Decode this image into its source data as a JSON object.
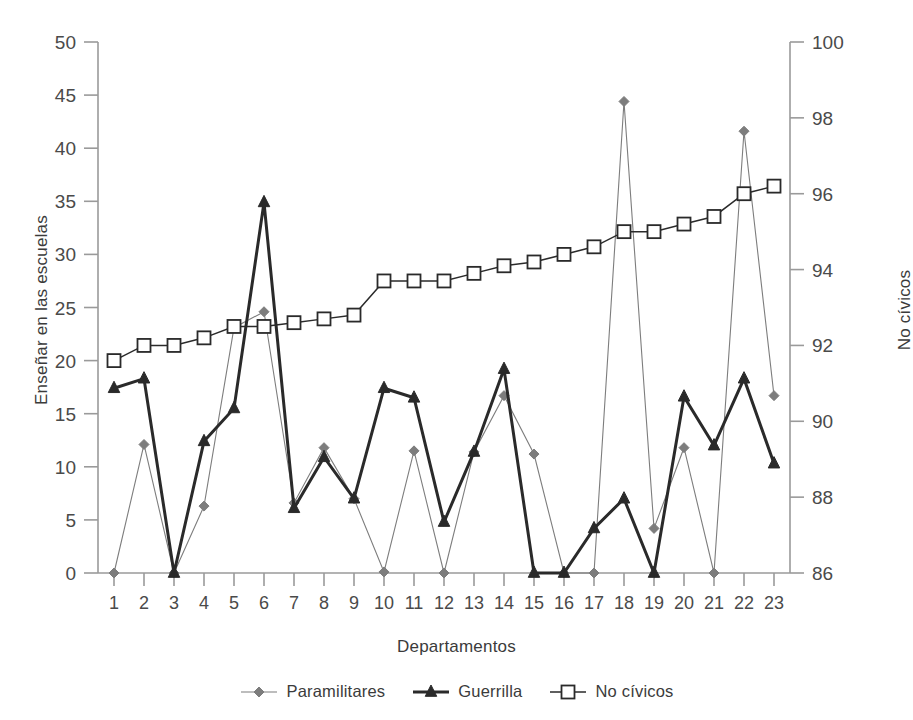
{
  "chart_data": {
    "type": "line",
    "title": "",
    "subtitle": "",
    "xlabel": "Departamentos",
    "ylabel": "Enseñar en las escuelas",
    "ylabel_right": "No cívicos",
    "categories": [
      "1",
      "2",
      "3",
      "4",
      "5",
      "6",
      "7",
      "8",
      "9",
      "10",
      "11",
      "12",
      "13",
      "14",
      "15",
      "16",
      "17",
      "18",
      "19",
      "20",
      "21",
      "22",
      "23"
    ],
    "x": [
      1,
      2,
      3,
      4,
      5,
      6,
      7,
      8,
      9,
      10,
      11,
      12,
      13,
      14,
      15,
      16,
      17,
      18,
      19,
      20,
      21,
      22,
      23
    ],
    "ylim": [
      0,
      50
    ],
    "yticks": [
      0,
      5,
      10,
      15,
      20,
      25,
      30,
      35,
      40,
      45,
      50
    ],
    "ylim_right": [
      86,
      100
    ],
    "yticks_right": [
      86,
      88,
      90,
      92,
      94,
      96,
      98,
      100
    ],
    "grid": false,
    "legend_position": "bottom",
    "series": [
      {
        "name": "Paramilitares",
        "axis": "left",
        "marker": "diamond",
        "color": "#7d7d7d",
        "values": [
          0.0,
          12.1,
          0.0,
          6.3,
          23.1,
          24.6,
          6.6,
          11.8,
          7.0,
          0.1,
          11.5,
          0.0,
          11.4,
          16.7,
          11.2,
          0.0,
          0.0,
          44.4,
          4.2,
          11.8,
          0.0,
          41.6,
          16.7
        ]
      },
      {
        "name": "Guerrilla",
        "axis": "left",
        "marker": "triangle",
        "color": "#2a2a2a",
        "values": [
          17.4,
          18.3,
          0.0,
          12.4,
          15.5,
          34.9,
          6.1,
          10.9,
          7.0,
          17.4,
          16.5,
          4.8,
          11.4,
          19.2,
          0.0,
          0.0,
          4.2,
          7.0,
          0.0,
          16.6,
          12.0,
          18.3,
          10.3
        ]
      },
      {
        "name": "No cívicos",
        "axis": "right",
        "marker": "square",
        "color": "#2a2a2a",
        "values": [
          91.6,
          92.0,
          92.0,
          92.2,
          92.5,
          92.5,
          92.6,
          92.7,
          92.8,
          93.7,
          93.7,
          93.7,
          93.9,
          94.1,
          94.2,
          94.4,
          94.6,
          95.0,
          95.0,
          95.2,
          95.4,
          96.0,
          96.2
        ]
      }
    ]
  },
  "axes": {
    "left_title": "Enseñar en las escuelas",
    "right_title": "No cívicos",
    "x_title": "Departamentos"
  },
  "legend": {
    "items": [
      {
        "label": "Paramilitares",
        "marker": "diamond-marker",
        "color": "#7d7d7d"
      },
      {
        "label": "Guerrilla",
        "marker": "triangle-marker",
        "color": "#2a2a2a"
      },
      {
        "label": "No cívicos",
        "marker": "square-marker",
        "color": "#2a2a2a"
      }
    ]
  },
  "colors": {
    "paramilitares": "#7d7d7d",
    "guerrilla": "#2a2a2a",
    "no_civicos": "#2a2a2a",
    "axis": "#9a9a9a",
    "text": "#3b3b3b"
  }
}
